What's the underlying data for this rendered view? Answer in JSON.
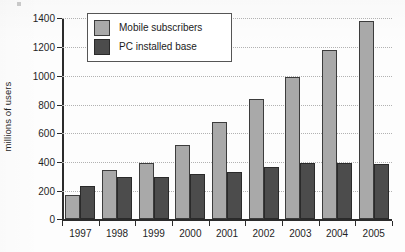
{
  "chart_data": {
    "type": "bar",
    "title": "",
    "subtitle": "",
    "xlabel": "",
    "ylabel": "millions of users",
    "categories": [
      "1997",
      "1998",
      "1999",
      "2000",
      "2001",
      "2002",
      "2003",
      "2004",
      "2005"
    ],
    "series": [
      {
        "name": "Mobile subscribers",
        "color": "#a9a9a9",
        "values": [
          170,
          345,
          395,
          520,
          680,
          840,
          990,
          1180,
          1380
        ]
      },
      {
        "name": "PC installed base",
        "color": "#4c4c4c",
        "values": [
          235,
          298,
          292,
          318,
          330,
          368,
          395,
          392,
          388
        ]
      }
    ],
    "ylim": [
      0,
      1400
    ],
    "yticks": [
      0,
      200,
      400,
      600,
      800,
      1000,
      1200,
      1400
    ],
    "ytick_labels": [
      "0",
      "200",
      "400",
      "600",
      "800",
      "1000",
      "1200",
      "1400"
    ],
    "grid": true,
    "grid_axis": "y",
    "grid_style": "dotted",
    "legend_position": "top-left-inside",
    "bar_mode": "grouped"
  },
  "legend": {
    "entries": [
      {
        "label": "Mobile subscribers",
        "swatch": "mobile"
      },
      {
        "label": "PC installed base",
        "swatch": "pc"
      }
    ]
  }
}
